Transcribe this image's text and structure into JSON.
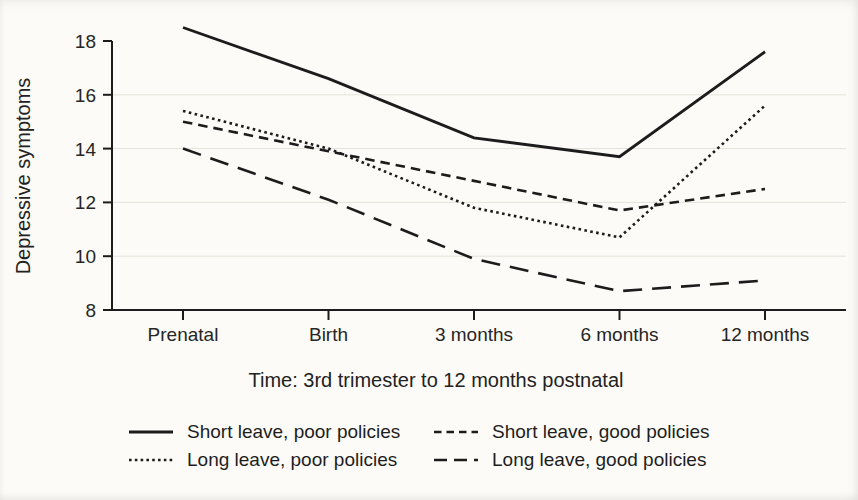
{
  "chart_data": {
    "type": "line",
    "title": "",
    "xlabel": "Time: 3rd trimester to 12 months postnatal",
    "ylabel": "Depressive symptoms",
    "categories": [
      "Prenatal",
      "Birth",
      "3 months",
      "6 months",
      "12 months"
    ],
    "ylim": [
      8,
      18
    ],
    "yticks": [
      8,
      10,
      12,
      14,
      16,
      18
    ],
    "grid": {
      "horizontal": true,
      "at": [
        10,
        12,
        14,
        16
      ],
      "color": "#e4e3da"
    },
    "line_color": "#1c1c1c",
    "axis_color": "#1c1c1c",
    "background_color": "#fcfbf7",
    "legend_position": "below chart, two columns",
    "legend_order": [
      0,
      2,
      1,
      3
    ],
    "series": [
      {
        "name": "Short leave, poor policies",
        "dash": "solid",
        "values": [
          18.5,
          16.6,
          14.4,
          13.7,
          17.6
        ]
      },
      {
        "name": "Long leave, poor policies",
        "dash": "dotted",
        "values": [
          15.4,
          14.0,
          11.8,
          10.7,
          15.6
        ]
      },
      {
        "name": "Short leave, good policies",
        "dash": "short-dash",
        "values": [
          15.0,
          13.9,
          12.8,
          11.7,
          12.5
        ]
      },
      {
        "name": "Long leave, good policies",
        "dash": "long-dash",
        "values": [
          14.0,
          12.1,
          9.9,
          8.7,
          9.1
        ]
      }
    ]
  }
}
